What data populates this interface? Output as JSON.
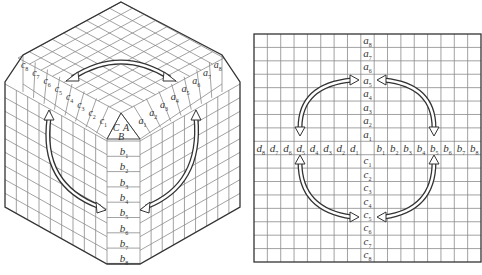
{
  "left_panel": {
    "title": "cube-view",
    "corner_labels": [
      "C",
      "A",
      "B"
    ],
    "a_labels": [
      "a1",
      "a2",
      "a3",
      "a4",
      "a5",
      "a6",
      "a7",
      "a8"
    ],
    "b_labels": [
      "b1",
      "b2",
      "b3",
      "b4",
      "b5",
      "b6",
      "b7",
      "b8"
    ],
    "c_labels": [
      "c1",
      "c2",
      "c3",
      "c4",
      "c5",
      "c6",
      "c7",
      "c8"
    ],
    "arrows": [
      "c5 <-> a5 (top face)",
      "c5 <-> b5 (left face)",
      "a5 <-> b5 (right face)"
    ]
  },
  "right_panel": {
    "title": "unfolded-grid-view",
    "grid_size": 17,
    "a_labels": [
      "a1",
      "a2",
      "a3",
      "a4",
      "a5",
      "a6",
      "a7",
      "a8"
    ],
    "b_labels": [
      "b1",
      "b2",
      "b3",
      "b4",
      "b5",
      "b6",
      "b7",
      "b8"
    ],
    "c_labels": [
      "c1",
      "c2",
      "c3",
      "c4",
      "c5",
      "c6",
      "c7",
      "c8"
    ],
    "d_labels": [
      "d1",
      "d2",
      "d3",
      "d4",
      "d5",
      "d6",
      "d7",
      "d8"
    ],
    "arrows": [
      "a5 <-> d5",
      "a5 <-> b5",
      "d5 <-> c5",
      "b5 <-> c5"
    ]
  },
  "colors": {
    "line": "#333333",
    "grid": "#8a8a8a",
    "background": "#ffffff"
  }
}
